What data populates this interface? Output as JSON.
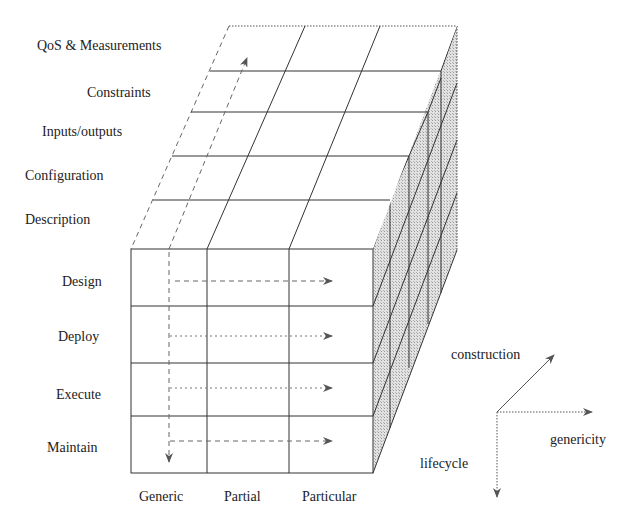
{
  "diagram": {
    "title": "",
    "construction_dimension": {
      "axis_label": "construction",
      "levels": [
        "Description",
        "Configuration",
        "Inputs/outputs",
        "Constraints",
        "QoS & Measurements"
      ]
    },
    "lifecycle_dimension": {
      "axis_label": "lifecycle",
      "levels": [
        "Design",
        "Deploy",
        "Execute",
        "Maintain"
      ]
    },
    "genericity_dimension": {
      "axis_label": "genericity",
      "levels": [
        "Generic",
        "Partial",
        "Particular"
      ]
    },
    "colors": {
      "line": "#333333",
      "side_face": "#dcdcdc",
      "background": "#ffffff"
    }
  },
  "labels": {
    "top": {
      "qos": "QoS & Measurements",
      "constraints": "Constraints",
      "io": "Inputs/outputs",
      "config": "Configuration",
      "description": "Description"
    },
    "front": {
      "design": "Design",
      "deploy": "Deploy",
      "execute": "Execute",
      "maintain": "Maintain"
    },
    "bottom": {
      "generic": "Generic",
      "partial": "Partial",
      "particular": "Particular"
    },
    "axes": {
      "construction": "construction",
      "genericity": "genericity",
      "lifecycle": "lifecycle"
    }
  }
}
